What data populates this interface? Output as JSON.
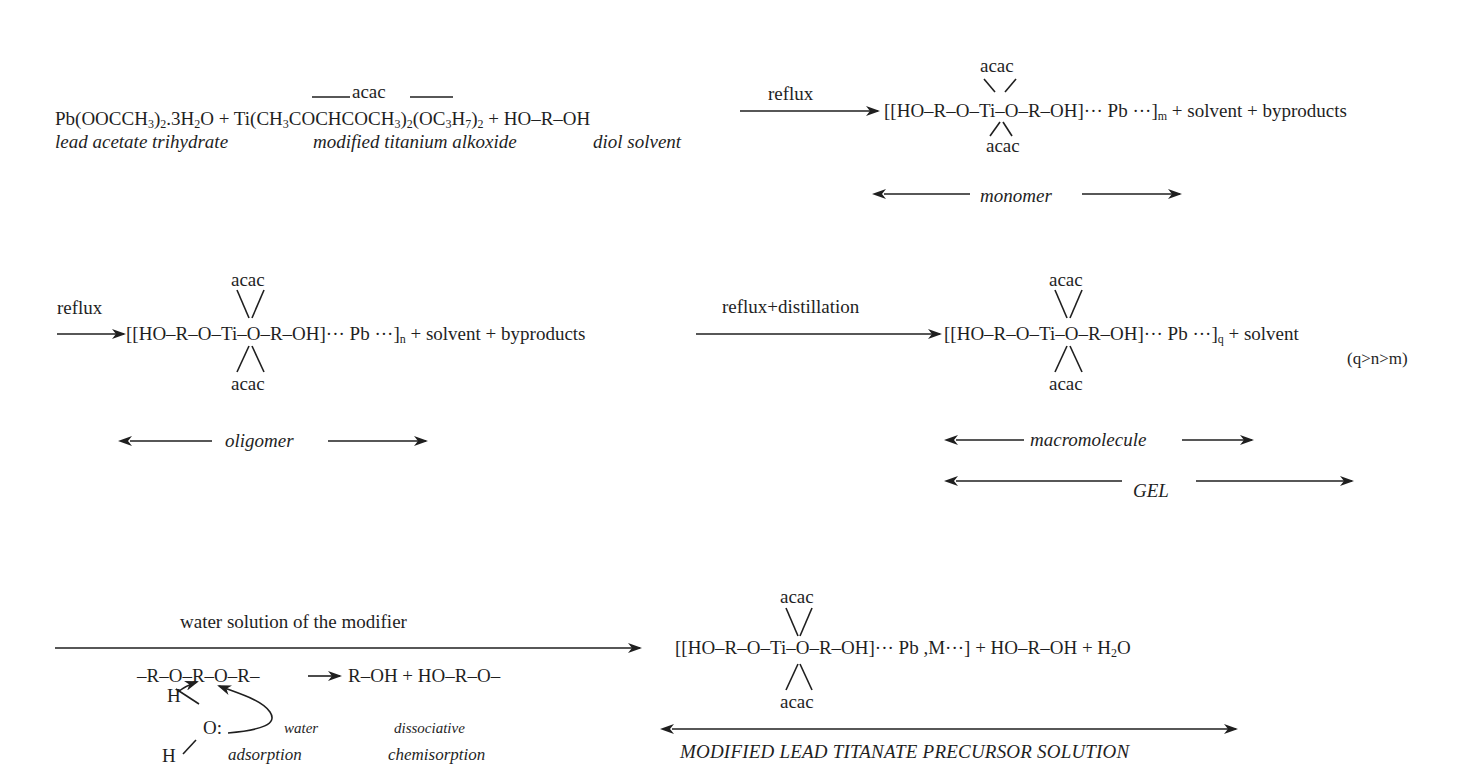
{
  "diagram": {
    "type": "reaction scheme",
    "step1": {
      "reactant1": {
        "pre": "Pb(OOCCH",
        "s1": "3",
        "mid": ")",
        "s2": "2",
        "post": ".3H",
        "s3": "2",
        "end": "O"
      },
      "plus1": "+",
      "reactant2": {
        "pre": "Ti(CH",
        "s1": "3",
        "mid1": "COCHCOCH",
        "s2": "3",
        "mid2": ")",
        "s3": "2",
        "mid3": "(OC",
        "s4": "3",
        "mid4": "H",
        "s5": "7",
        "mid5": ")",
        "s6": "2"
      },
      "reactant2_overlabel": "acac",
      "plus2": "+",
      "reactant3": "HO–R–OH",
      "label1": "lead acetate trihydrate",
      "label2": "modified titanium alkoxide",
      "label3": "diol solvent",
      "arrow_label": "reflux",
      "product": {
        "core": "[[HO–R–O–Ti–O–R–OH]··· Pb ···]",
        "subscript": "m",
        "tail": "+ solvent + byproducts"
      },
      "acac_top": "acac",
      "acac_bottom": "acac",
      "span_label": "monomer"
    },
    "step2": {
      "arrow_label": "reflux",
      "product": {
        "core": "[[HO–R–O–Ti–O–R–OH]··· Pb ···]",
        "subscript": "n",
        "tail": "+ solvent + byproducts"
      },
      "acac_top": "acac",
      "acac_bottom": "acac",
      "span_label": "oligomer"
    },
    "step3": {
      "arrow_label": "reflux+distillation",
      "product": {
        "core": "[[HO–R–O–Ti–O–R–OH]··· Pb ···]",
        "subscript": "q",
        "tail": "+ solvent"
      },
      "acac_top": "acac",
      "acac_bottom": "acac",
      "condition": "(q>n>m)",
      "span_label_1": "macromolecule",
      "span_label_2": "GEL"
    },
    "step4": {
      "arrow_label": "water solution of the modifier",
      "mechanism": {
        "chain": "–R–O–R–O–R–",
        "products": "R–OH + HO–R–O–",
        "h_top": "H",
        "o": "O:",
        "h_bottom": "H",
        "label_water": "water",
        "label_adsorption": "adsorption",
        "label_dissociative": "dissociative",
        "label_chemisorption": "chemisorption"
      },
      "product": {
        "core": "[[HO–R–O–Ti–O–R–OH]··· Pb ,M···]",
        "tail_pre": "+ HO–R–OH + H",
        "tail_sub": "2",
        "tail_end": "O"
      },
      "acac_top": "acac",
      "acac_bottom": "acac",
      "span_label": "MODIFIED LEAD TITANATE PRECURSOR SOLUTION"
    }
  }
}
